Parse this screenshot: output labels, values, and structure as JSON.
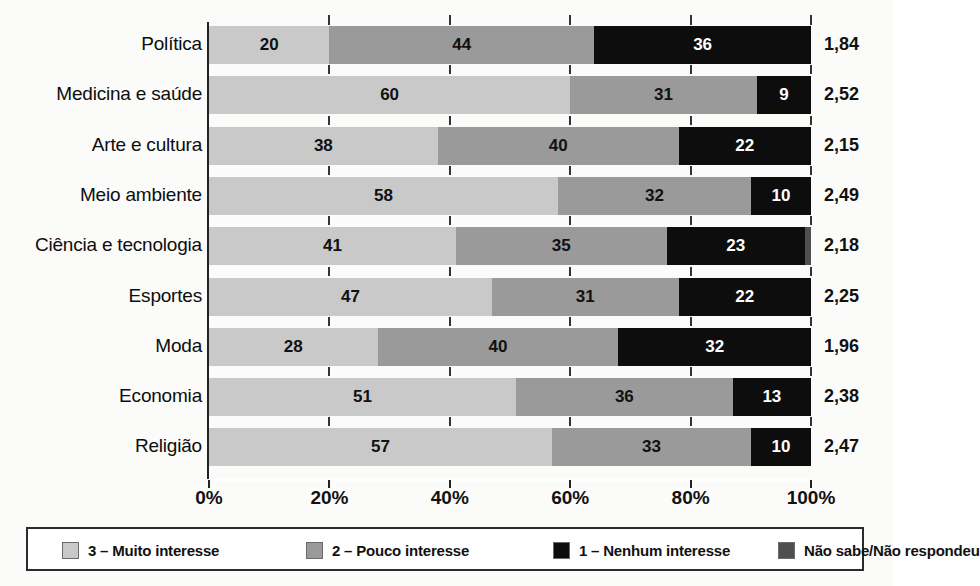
{
  "chart_data": {
    "type": "bar",
    "orientation": "horizontal",
    "stacked": true,
    "normalized_percent": true,
    "title": "",
    "subtitle": "",
    "xlabel": "",
    "ylabel": "",
    "xlim": [
      0,
      100
    ],
    "xticks": [
      "0%",
      "20%",
      "40%",
      "60%",
      "80%",
      "100%"
    ],
    "xtick_values": [
      0,
      20,
      40,
      60,
      80,
      100
    ],
    "grid": false,
    "legend_position": "bottom",
    "categories": [
      "Política",
      "Medicina e saúde",
      "Arte e cultura",
      "Meio ambiente",
      "Ciência e tecnologia",
      "Esportes",
      "Moda",
      "Economia",
      "Religião"
    ],
    "series": [
      {
        "name": "3 – Muito interesse",
        "key": "c3",
        "color": "#c9c9c9",
        "values": [
          20,
          60,
          38,
          58,
          41,
          47,
          28,
          51,
          57
        ]
      },
      {
        "name": "2 – Pouco interesse",
        "key": "c2",
        "color": "#9a9a9a",
        "values": [
          44,
          31,
          40,
          32,
          35,
          31,
          40,
          36,
          33
        ]
      },
      {
        "name": "1 – Nenhum interesse",
        "key": "c1",
        "color": "#0d0d0d",
        "values": [
          36,
          9,
          22,
          10,
          23,
          22,
          32,
          13,
          10
        ]
      },
      {
        "name": "Não sabe/Não respondeu",
        "key": "c0",
        "color": "#4f4f4f",
        "values": [
          0,
          0,
          0,
          0,
          1,
          0,
          0,
          0,
          0
        ]
      }
    ],
    "value_labels": [
      [
        "20",
        "44",
        "36",
        ""
      ],
      [
        "60",
        "31",
        "9",
        ""
      ],
      [
        "38",
        "40",
        "22",
        ""
      ],
      [
        "58",
        "32",
        "10",
        ""
      ],
      [
        "41",
        "35",
        "23",
        ""
      ],
      [
        "47",
        "31",
        "22",
        ""
      ],
      [
        "28",
        "40",
        "32",
        ""
      ],
      [
        "51",
        "36",
        "13",
        ""
      ],
      [
        "57",
        "33",
        "10",
        ""
      ]
    ],
    "annotation_column": {
      "label": "",
      "values": [
        "1,84",
        "2,52",
        "2,15",
        "2,49",
        "2,18",
        "2,25",
        "1,96",
        "2,38",
        "2,47"
      ]
    },
    "legend": [
      {
        "label": "3 – Muito interesse",
        "color": "#c9c9c9"
      },
      {
        "label": "2 – Pouco interesse",
        "color": "#9a9a9a"
      },
      {
        "label": "1 – Nenhum interesse",
        "color": "#0d0d0d"
      },
      {
        "label": "Não sabe/Não respondeu",
        "color": "#4f4f4f"
      }
    ]
  }
}
